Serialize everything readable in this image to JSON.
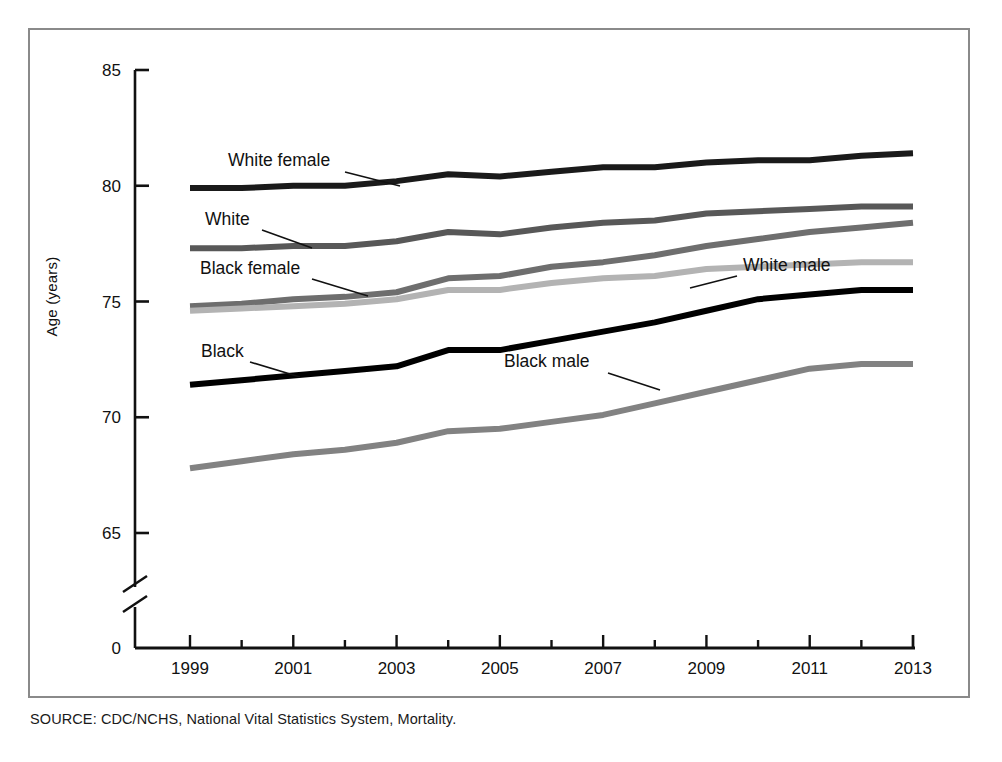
{
  "figure": {
    "source_note": "SOURCE: CDC/NCHS, National Vital Statistics System, Mortality.",
    "y_axis_title": "Age (years)",
    "zero_label": "0"
  },
  "chart_data": {
    "type": "line",
    "title": "",
    "xlabel": "",
    "ylabel": "Age (years)",
    "x": [
      1999,
      2000,
      2001,
      2002,
      2003,
      2004,
      2005,
      2006,
      2007,
      2008,
      2009,
      2010,
      2011,
      2012,
      2013
    ],
    "xlim": [
      1999,
      2013
    ],
    "ylim": [
      65,
      85
    ],
    "y_ticks": [
      65,
      70,
      75,
      80,
      85
    ],
    "y_tick_labels": [
      "65",
      "70",
      "75",
      "80",
      "85"
    ],
    "x_ticks": [
      1999,
      2000,
      2001,
      2002,
      2003,
      2004,
      2005,
      2006,
      2007,
      2008,
      2009,
      2010,
      2011,
      2012,
      2013
    ],
    "x_tick_labels": [
      "1999",
      "",
      "2001",
      "",
      "2003",
      "",
      "2005",
      "",
      "2007",
      "",
      "2009",
      "",
      "2011",
      "",
      "2013"
    ],
    "axis_break": true,
    "axis_break_note": "y-axis broken between 0 and 65",
    "grid": false,
    "legend": "inline-labels",
    "series": [
      {
        "name": "White female",
        "color": "#1a1a1a",
        "values": [
          79.9,
          79.9,
          80.0,
          80.0,
          80.2,
          80.5,
          80.4,
          80.6,
          80.8,
          80.8,
          81.0,
          81.1,
          81.1,
          81.3,
          81.4
        ]
      },
      {
        "name": "White",
        "color": "#585858",
        "values": [
          77.3,
          77.3,
          77.4,
          77.4,
          77.6,
          78.0,
          77.9,
          78.2,
          78.4,
          78.5,
          78.8,
          78.9,
          79.0,
          79.1,
          79.1
        ]
      },
      {
        "name": "Black female",
        "color": "#6e6e6e",
        "values": [
          74.8,
          74.9,
          75.1,
          75.2,
          75.4,
          76.0,
          76.1,
          76.5,
          76.7,
          77.0,
          77.4,
          77.7,
          78.0,
          78.2,
          78.4
        ]
      },
      {
        "name": "White male",
        "color": "#b3b3b3",
        "values": [
          74.6,
          74.7,
          74.8,
          74.9,
          75.1,
          75.5,
          75.5,
          75.8,
          76.0,
          76.1,
          76.4,
          76.5,
          76.6,
          76.7,
          76.7
        ]
      },
      {
        "name": "Black",
        "color": "#000000",
        "values": [
          71.4,
          71.6,
          71.8,
          72.0,
          72.2,
          72.9,
          72.9,
          73.3,
          73.7,
          74.1,
          74.6,
          75.1,
          75.3,
          75.5,
          75.5
        ]
      },
      {
        "name": "Black male",
        "color": "#828282",
        "values": [
          67.8,
          68.1,
          68.4,
          68.6,
          68.9,
          69.4,
          69.5,
          69.8,
          70.1,
          70.6,
          71.1,
          71.6,
          72.1,
          72.3,
          72.3
        ]
      }
    ],
    "annotations": [
      {
        "text": "White female",
        "x_px": 228,
        "y_px": 166,
        "leader": "to the White female line"
      },
      {
        "text": "White",
        "x_px": 205,
        "y_px": 225,
        "leader": "to the White line"
      },
      {
        "text": "Black female",
        "x_px": 200,
        "y_px": 274,
        "leader": "to the Black female line"
      },
      {
        "text": "White male",
        "x_px": 743,
        "y_px": 271,
        "leader": "to the White male line"
      },
      {
        "text": "Black",
        "x_px": 201,
        "y_px": 357,
        "leader": "to the Black line"
      },
      {
        "text": "Black male",
        "x_px": 504,
        "y_px": 367,
        "leader": "to the Black male line"
      }
    ]
  }
}
